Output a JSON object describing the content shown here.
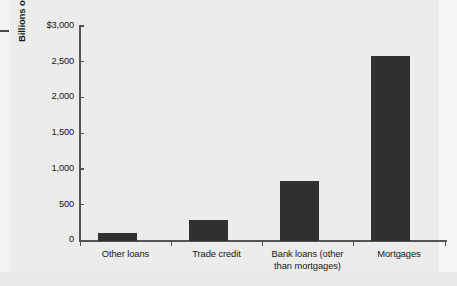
{
  "chart_data": {
    "type": "bar",
    "title": "",
    "subtitle": "",
    "xlabel": "",
    "ylabel": "Billions of dollars",
    "categories": [
      "Other loans",
      "Trade credit",
      "Bank loans (other than mortgages)",
      "Mortgages"
    ],
    "category_lines": [
      [
        "Other loans"
      ],
      [
        "Trade credit"
      ],
      [
        "Bank loans (other",
        "than mortgages)"
      ],
      [
        "Mortgages"
      ]
    ],
    "values": [
      110,
      295,
      830,
      2580
    ],
    "ylim": [
      0,
      3000
    ],
    "ytick_values": [
      0,
      500,
      1000,
      1500,
      2000,
      2500,
      3000
    ],
    "ytick_labels": [
      "0",
      "500",
      "1,000",
      "1,500",
      "2,000",
      "2,500",
      "$3,000"
    ],
    "grid": false,
    "legend": null,
    "bar_color": "#303030",
    "axis_color": "#545454",
    "background_color": "#ececea"
  }
}
